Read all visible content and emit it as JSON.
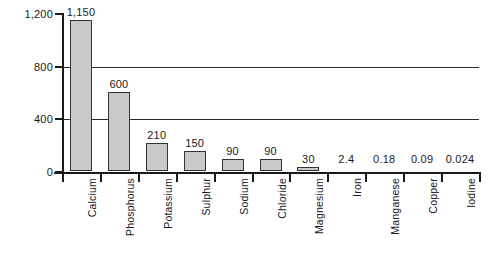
{
  "chart_data": {
    "type": "bar",
    "title": "",
    "xlabel": "",
    "ylabel": "Amount (g)",
    "ylim": [
      0,
      1200
    ],
    "yticks": [
      0,
      400,
      800,
      1200
    ],
    "ytick_labels": [
      "0",
      "400",
      "800",
      "1,200"
    ],
    "grid": "horizontal gridlines at 400 and 800",
    "legend": "none",
    "categories": [
      "Calcium",
      "Phosphorus",
      "Potassium",
      "Sulphur",
      "Sodium",
      "Chloride",
      "Magnesium",
      "Iron",
      "Manganese",
      "Copper",
      "Iodine"
    ],
    "values": [
      1150,
      600,
      210,
      150,
      90,
      90,
      30,
      2.4,
      0.18,
      0.09,
      0.024
    ],
    "value_labels": [
      "1,150",
      "600",
      "210",
      "150",
      "90",
      "90",
      "30",
      "2.4",
      "0.18",
      "0.09",
      "0.024"
    ],
    "bar_color": "#c9c9c9",
    "bar_border_color": "#333333",
    "axis_color": "#1a1a1a",
    "background_color": "#ffffff"
  }
}
